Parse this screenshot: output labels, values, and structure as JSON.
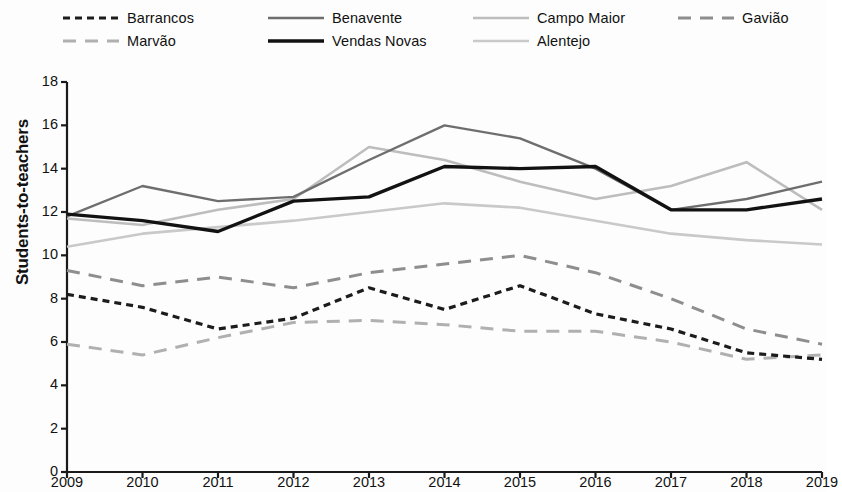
{
  "chart_data": {
    "type": "line",
    "title": "",
    "xlabel": "",
    "ylabel": "Students-to-teachers",
    "categories": [
      "2009",
      "2010",
      "2011",
      "2012",
      "2013",
      "2014",
      "2015",
      "2016",
      "2017",
      "2018",
      "2019"
    ],
    "x": [
      2009,
      2010,
      2011,
      2012,
      2013,
      2014,
      2015,
      2016,
      2017,
      2018,
      2019
    ],
    "ylim": [
      0,
      18
    ],
    "ytick_step": 2,
    "yticks": [
      "0",
      "2",
      "4",
      "6",
      "8",
      "10",
      "12",
      "14",
      "16",
      "18"
    ],
    "grid": false,
    "legend_position": "top",
    "series": [
      {
        "name": "Barrancos",
        "values": [
          8.2,
          7.6,
          6.6,
          7.1,
          8.5,
          7.5,
          8.6,
          7.3,
          6.6,
          5.5,
          5.2
        ],
        "color": "#1c1c1c",
        "style": "dotted",
        "width": 3.2,
        "dash": "7,5"
      },
      {
        "name": "Benavente",
        "values": [
          11.8,
          13.2,
          12.5,
          12.7,
          14.4,
          16.0,
          15.4,
          14.0,
          12.1,
          12.6,
          13.4
        ],
        "color": "#6e6e6e",
        "style": "solid",
        "width": 2.4,
        "dash": "none"
      },
      {
        "name": "Campo Maior",
        "values": [
          11.7,
          11.4,
          12.1,
          12.6,
          15.0,
          14.4,
          13.4,
          12.6,
          13.2,
          14.3,
          12.1
        ],
        "color": "#bdbdbd",
        "style": "solid",
        "width": 2.6,
        "dash": "none"
      },
      {
        "name": "Gavião",
        "values": [
          9.3,
          8.6,
          9.0,
          8.5,
          9.2,
          9.6,
          10.0,
          9.2,
          8.0,
          6.6,
          5.9
        ],
        "color": "#8e8e8e",
        "style": "dashed",
        "width": 3.0,
        "dash": "13,9"
      },
      {
        "name": "Marvão",
        "values": [
          5.9,
          5.4,
          6.2,
          6.9,
          7.0,
          6.8,
          6.5,
          6.5,
          6.0,
          5.2,
          5.4
        ],
        "color": "#b0b0b0",
        "style": "dashed",
        "width": 3.0,
        "dash": "13,9"
      },
      {
        "name": "Vendas Novas",
        "values": [
          11.9,
          11.6,
          11.1,
          12.5,
          12.7,
          14.1,
          14.0,
          14.1,
          12.1,
          12.1,
          12.6
        ],
        "color": "#121212",
        "style": "solid",
        "width": 3.4,
        "dash": "none"
      },
      {
        "name": "Alentejo",
        "values": [
          10.4,
          11.0,
          11.3,
          11.6,
          12.0,
          12.4,
          12.2,
          11.6,
          11.0,
          10.7,
          10.5
        ],
        "color": "#c9c9c9",
        "style": "solid",
        "width": 2.6,
        "dash": "none"
      }
    ]
  },
  "legend": {
    "items": [
      {
        "label": "Barrancos",
        "row": 0,
        "col": 0
      },
      {
        "label": "Benavente",
        "row": 0,
        "col": 1
      },
      {
        "label": "Campo Maior",
        "row": 0,
        "col": 2
      },
      {
        "label": "Gavião",
        "row": 0,
        "col": 3
      },
      {
        "label": "Marvão",
        "row": 1,
        "col": 0
      },
      {
        "label": "Vendas Novas",
        "row": 1,
        "col": 1
      },
      {
        "label": "Alentejo",
        "row": 1,
        "col": 2
      }
    ]
  },
  "axes": {
    "y_title": "Students-to-teachers",
    "axis_color": "#1a1a1a"
  }
}
